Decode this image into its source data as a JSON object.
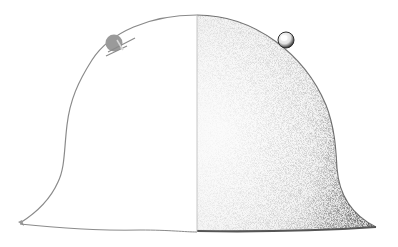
{
  "figure": {
    "subject": "helmet illustration",
    "left_half_style": "outline",
    "right_half_style": "stippled",
    "colors": {
      "background": "#ffffff",
      "outline": "#8a8a8a",
      "center_line": "#b8b8b8",
      "stipple_dark": "#3a3a3a",
      "stipple_light": "#f2f2f2",
      "rivet_left": "#9a9a9a",
      "rivet_right_edge": "#2e2e2e",
      "brim_edge": "#555555"
    },
    "parts": {
      "left_rivet": "rivet-icon",
      "right_rivet": "rivet-icon",
      "center_line": "divider"
    }
  }
}
